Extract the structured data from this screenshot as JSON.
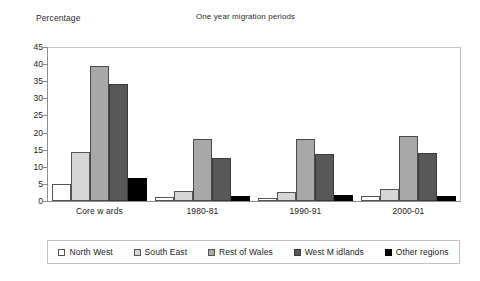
{
  "chart_data": {
    "type": "bar",
    "title": "One year migration periods",
    "xlabel": "",
    "ylabel": "Percentage",
    "ylim": [
      0,
      45
    ],
    "yticks": [
      0,
      5,
      10,
      15,
      20,
      25,
      30,
      35,
      40,
      45
    ],
    "grid": false,
    "legend_position": "bottom",
    "categories": [
      "Core w ards",
      "1980-81",
      "1990-91",
      "2000-01"
    ],
    "series": [
      {
        "name": "North West",
        "color": "#ffffff",
        "values": [
          5.0,
          1.2,
          1.0,
          1.6
        ]
      },
      {
        "name": "South East",
        "color": "#d6d6d6",
        "values": [
          14.4,
          2.9,
          2.5,
          3.4
        ]
      },
      {
        "name": "Rest of Wales",
        "color": "#a8a8a8",
        "values": [
          39.5,
          18.0,
          18.0,
          19.0
        ]
      },
      {
        "name": "West M idlands",
        "color": "#585858",
        "values": [
          34.2,
          12.5,
          13.8,
          14.0
        ]
      },
      {
        "name": "Other regions",
        "color": "#000000",
        "values": [
          6.8,
          1.6,
          1.7,
          1.4
        ]
      }
    ]
  },
  "labels": {
    "y_axis_caption": "Percentage",
    "chart_title": "One year migration periods"
  }
}
